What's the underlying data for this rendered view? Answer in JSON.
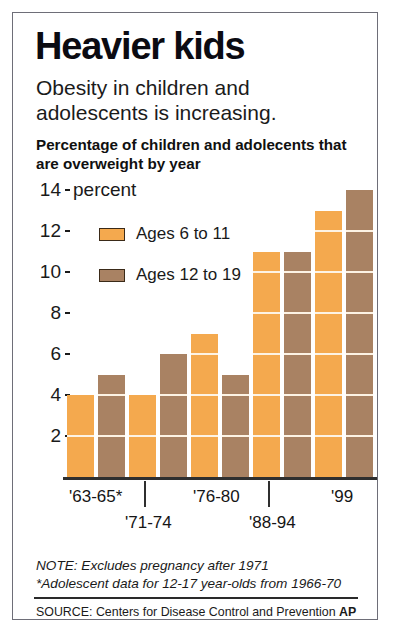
{
  "headline": "Heavier kids",
  "deck": "Obesity in children and adolescents is increasing.",
  "subhead": "Percentage of children and adolecents that are overweight by year",
  "axis_unit_label": "percent",
  "legend": [
    {
      "label": "Ages 6 to 11",
      "color": "#F4A94E"
    },
    {
      "label": "Ages 12 to 19",
      "color": "#A98263"
    }
  ],
  "notes": {
    "line1": "NOTE: Excludes pregnancy after 1971",
    "line2": "*Adolescent data for 12-17 year-olds from 1966-70"
  },
  "source": {
    "text": "SOURCE: Centers for Disease Control and Prevention",
    "credit": "AP"
  },
  "colors": {
    "series1": "#F4A94E",
    "series2": "#A98263",
    "segment_line": "#FDF3E4",
    "axis": "#2F2F2F",
    "border": "#6E6E78"
  },
  "chart_data": {
    "type": "bar",
    "title": "Heavier kids",
    "subtitle": "Obesity in children and adolescents is increasing.",
    "xlabel": "",
    "ylabel": "percent",
    "ylim": [
      0,
      14
    ],
    "yticks": [
      2,
      4,
      6,
      8,
      10,
      12,
      14
    ],
    "grid": false,
    "legend_position": "upper-left",
    "categories": [
      "'63-65*",
      "'71-74",
      "'76-80",
      "'88-94",
      "'99"
    ],
    "series": [
      {
        "name": "Ages 6 to 11",
        "color": "#F4A94E",
        "values": [
          4,
          4,
          7,
          11,
          13
        ]
      },
      {
        "name": "Ages 12 to 19",
        "color": "#A98263",
        "values": [
          5,
          6,
          5,
          11,
          14
        ]
      }
    ],
    "annotations": [
      "NOTE: Excludes pregnancy after 1971",
      "*Adolescent data for 12-17 year-olds from 1966-70"
    ],
    "source": "SOURCE: Centers for Disease Control and Prevention  AP"
  }
}
